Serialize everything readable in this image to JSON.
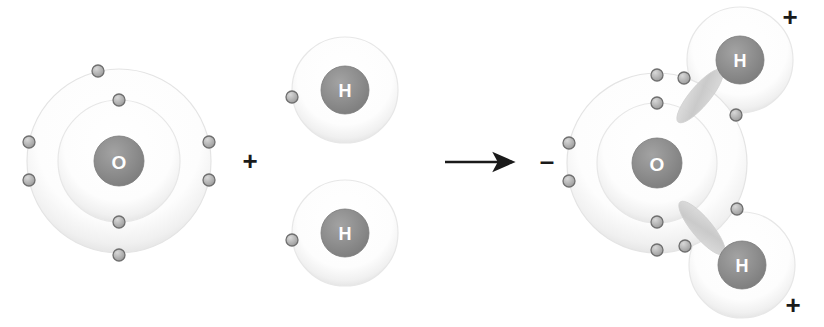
{
  "diagram": {
    "background": "#ffffff",
    "colors": {
      "nucleus_fill": "#8c8c8c",
      "nucleus_rim": "#7a7a7a",
      "nucleus_label": "#ffffff",
      "shell_fill": "#fbfbfb",
      "shell_stroke": "#e3e3e3",
      "electron_fill": "#b6b6b6",
      "electron_stroke": "#6f6f6f",
      "bond_fill": "#d2d2d2",
      "ink": "#1a1a1a"
    },
    "operators": {
      "plus_sign": "+",
      "arrow_glyph": "arrow-right"
    },
    "charges": {
      "negative": "–",
      "positive": "+"
    },
    "reactants": [
      {
        "id": "oxygen-atom",
        "symbol": "O",
        "name": "oxygen",
        "cx": 119,
        "cy": 161,
        "nucleus_r": 25,
        "shells": [
          {
            "index": 1,
            "r": 61,
            "electrons": 2
          },
          {
            "index": 2,
            "r": 92,
            "electrons": 6
          }
        ],
        "electron_positions": [
          {
            "shell": 1,
            "angle": -90
          },
          {
            "shell": 1,
            "angle": 90
          },
          {
            "shell": 2,
            "angle": -103
          },
          {
            "shell": 2,
            "angle": 77
          },
          {
            "shell": 2,
            "angle": 168
          },
          {
            "shell": 2,
            "angle": 192
          },
          {
            "shell": 2,
            "angle": 12
          },
          {
            "shell": 2,
            "angle": -12
          }
        ]
      },
      {
        "id": "hydrogen-atom-top",
        "symbol": "H",
        "name": "hydrogen",
        "cx": 345,
        "cy": 90,
        "nucleus_r": 24,
        "shells": [
          {
            "index": 1,
            "r": 53,
            "electrons": 1
          }
        ],
        "electron_positions": [
          {
            "shell": 1,
            "angle": 180
          }
        ]
      },
      {
        "id": "hydrogen-atom-bottom",
        "symbol": "H",
        "name": "hydrogen",
        "cx": 345,
        "cy": 233,
        "nucleus_r": 24,
        "shells": [
          {
            "index": 1,
            "r": 53,
            "electrons": 1
          }
        ],
        "electron_positions": [
          {
            "shell": 1,
            "angle": 180
          }
        ]
      }
    ],
    "product": {
      "id": "water-molecule",
      "formula": "H2O",
      "oxygen": {
        "symbol": "O",
        "cx": 657,
        "cy": 163,
        "nucleus_r": 25,
        "shells": [
          {
            "index": 1,
            "r": 60,
            "electrons": 2
          },
          {
            "index": 2,
            "r": 90,
            "electrons": 6
          }
        ],
        "charge_label": "–",
        "charge_x": 547,
        "charge_y": 161
      },
      "hydrogens": [
        {
          "symbol": "H",
          "cx": 740,
          "cy": 60,
          "nucleus_r": 24,
          "shell_r": 53,
          "charge_label": "+",
          "charge_x": 790,
          "charge_y": 17
        },
        {
          "symbol": "H",
          "cx": 742,
          "cy": 265,
          "nucleus_r": 24,
          "shell_r": 53,
          "charge_label": "+",
          "charge_x": 793,
          "charge_y": 305
        }
      ],
      "bonds": [
        {
          "id": "covalent-bond-top",
          "type": "covalent",
          "shared_electrons": 2
        },
        {
          "id": "covalent-bond-bottom",
          "type": "covalent",
          "shared_electrons": 2
        }
      ]
    },
    "arrow": {
      "x1": 445,
      "y1": 162,
      "x2": 512,
      "y2": 162
    },
    "plus": {
      "x": 250,
      "y": 161
    }
  }
}
